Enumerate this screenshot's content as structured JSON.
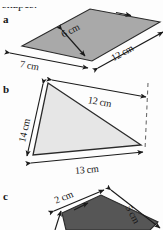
{
  "figure": {
    "heading_text": "shapes.",
    "background_color": "#fdfdfd",
    "ink_color": "#161616",
    "parts": [
      {
        "label": "a",
        "shape": "parallelogram",
        "fill_color": "#a9a9a9",
        "dimensions": [
          {
            "value": "6 cm",
            "name": "height"
          },
          {
            "value": "12 cm",
            "name": "long-side"
          },
          {
            "value": "7 cm",
            "name": "short-side"
          }
        ]
      },
      {
        "label": "b",
        "shape": "triangle",
        "fill_color": "#e6e6e6",
        "dimensions": [
          {
            "value": "12 cm",
            "name": "upper-side"
          },
          {
            "value": "14 cm",
            "name": "left-side"
          },
          {
            "value": "13 cm",
            "name": "base"
          }
        ]
      },
      {
        "label": "c",
        "shape": "quadrilateral",
        "fill_color": "#565656",
        "dimensions": [
          {
            "value": "2 cm",
            "name": "top-side"
          },
          {
            "value": "5 cm",
            "name": "right-side"
          }
        ]
      }
    ]
  },
  "labels": {
    "a": "a",
    "b": "b",
    "c": "c",
    "a_dim_height": "6 cm",
    "a_dim_long": "12 cm",
    "a_dim_short": "7 cm",
    "b_dim_upper": "12 cm",
    "b_dim_left": "14 cm",
    "b_dim_base": "13 cm",
    "c_dim_top": "2 cm",
    "c_dim_right": "5 cm",
    "heading": "shapes."
  }
}
